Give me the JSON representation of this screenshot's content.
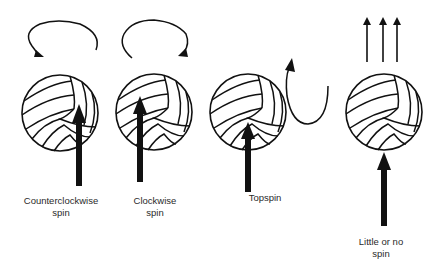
{
  "figure": {
    "ink_color": "#111111",
    "text_color": "#2a2a2a",
    "background": "#ffffff"
  },
  "panels": [
    {
      "id": "counterclockwise",
      "label_line1": "Counterclockwise",
      "label_line2": "spin",
      "motion_icon": "counterclockwise-rotation-arrow",
      "hit_arrow": "contact-arrow-right-of-center"
    },
    {
      "id": "clockwise",
      "label_line1": "Clockwise",
      "label_line2": "spin",
      "motion_icon": "clockwise-rotation-arrow",
      "hit_arrow": "contact-arrow-left-of-center"
    },
    {
      "id": "topspin",
      "label_line1": "Topspin",
      "label_line2": "",
      "motion_icon": "topspin-loop-arrow",
      "hit_arrow": "contact-arrow-below-center"
    },
    {
      "id": "no-spin",
      "label_line1": "Little or no",
      "label_line2": "spin",
      "motion_icon": "straight-up-arrows",
      "hit_arrow": "contact-arrow-bottom-center"
    }
  ]
}
